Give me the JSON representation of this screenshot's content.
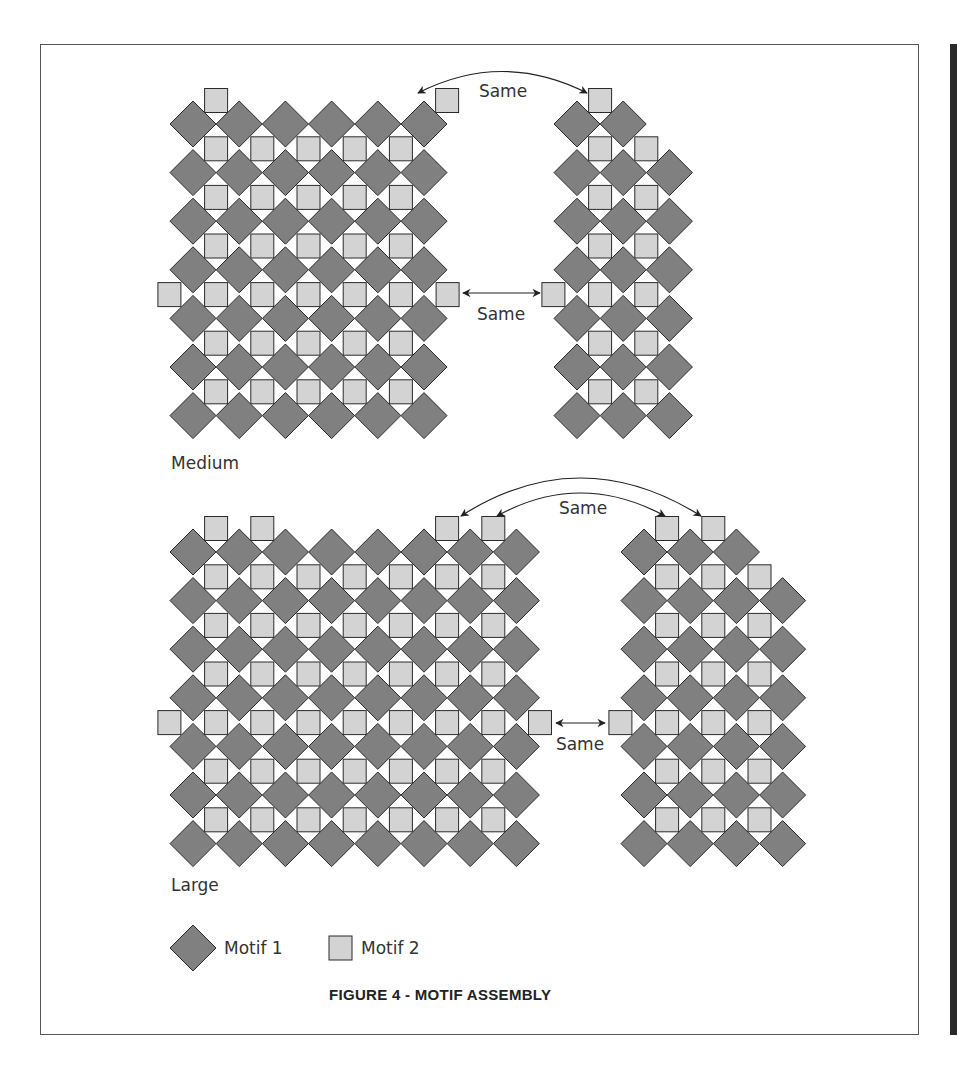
{
  "figure": {
    "caption": "FIGURE 4 - MOTIF ASSEMBLY",
    "colors": {
      "motif1_fill": "#808080",
      "motif2_fill": "#d3d3d3",
      "outline": "#2b2b2b",
      "frame": "#555555",
      "side_bar": "#2a2a2a"
    }
  },
  "legend": {
    "items": [
      {
        "shape": "diamond",
        "label": "Motif 1"
      },
      {
        "shape": "square",
        "label": "Motif 2"
      }
    ]
  },
  "annotations": {
    "same_label": "Same"
  },
  "assemblies": [
    {
      "name": "Medium",
      "label": "Medium",
      "label_pos": [
        171,
        469
      ],
      "blocks": [
        {
          "id": "medium-left",
          "diamond_rows": [
            6,
            6,
            6,
            6,
            6,
            6,
            6
          ],
          "first_center": [
            193,
            124
          ],
          "top_squares_cols": [
            0,
            5
          ],
          "inner_square_cols": 5,
          "side_square_gap": 3,
          "side_square_left": true,
          "side_square_right": true
        },
        {
          "id": "medium-right",
          "diamond_rows": [
            2,
            3,
            3,
            3,
            3,
            3,
            3
          ],
          "first_center": [
            577,
            124
          ],
          "top_squares_cols": [
            0
          ],
          "inner_square_cols": 2,
          "side_square_gap": 3,
          "side_square_left": true,
          "side_square_right": false
        }
      ]
    },
    {
      "name": "Large",
      "label": "Large",
      "label_pos": [
        171,
        891
      ],
      "blocks": [
        {
          "id": "large-left",
          "diamond_rows": [
            8,
            8,
            8,
            8,
            8,
            8,
            8
          ],
          "first_center": [
            193,
            552
          ],
          "top_squares_cols": [
            0,
            1,
            5,
            6
          ],
          "inner_square_cols": 7,
          "side_square_gap": 3,
          "side_square_left": true,
          "side_square_right": true
        },
        {
          "id": "large-right",
          "diamond_rows": [
            3,
            4,
            4,
            4,
            4,
            4,
            4
          ],
          "first_center": [
            644,
            552
          ],
          "top_squares_cols": [
            0,
            1
          ],
          "inner_square_cols": 3,
          "side_square_gap": 3,
          "side_square_left": true,
          "side_square_right": false
        }
      ]
    }
  ]
}
